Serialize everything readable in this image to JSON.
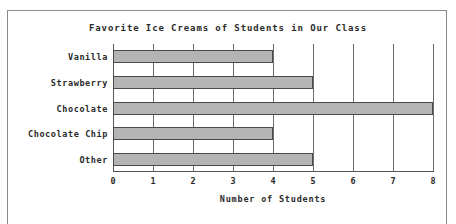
{
  "chart_data": {
    "type": "bar",
    "orientation": "horizontal",
    "title": "Favorite Ice Creams of Students in Our Class",
    "xlabel": "Number of Students",
    "ylabel": "",
    "categories": [
      "Vanilla",
      "Strawberry",
      "Chocolate",
      "Chocolate Chip",
      "Other"
    ],
    "values": [
      4,
      5,
      8,
      4,
      5
    ],
    "xticks": [
      "0",
      "1",
      "2",
      "3",
      "4",
      "5",
      "6",
      "7",
      "8"
    ],
    "xlim": [
      0,
      8
    ],
    "grid": true,
    "legend": false,
    "bar_color": "#b4b4b4",
    "bar_edge_color": "#4a4a4a",
    "grid_color": "#6e6e6e",
    "axis_color": "#555555",
    "text_color": "#2a2a2a",
    "background": "#ffffff"
  }
}
